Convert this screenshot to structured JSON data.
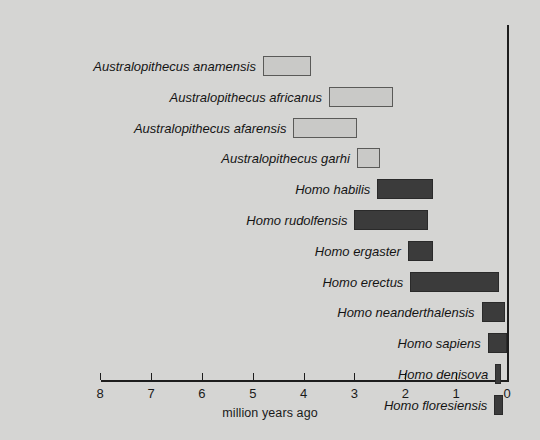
{
  "chart_data": {
    "type": "bar",
    "orientation": "horizontal-range",
    "title": "",
    "xlabel": "million years ago",
    "ylabel": "",
    "xlim": [
      8,
      0
    ],
    "x_ticks": [
      8,
      7,
      6,
      5,
      4,
      3,
      2,
      1,
      0
    ],
    "x_tick_labels": [
      "8",
      "7",
      "6",
      "5",
      "4",
      "3",
      "2",
      "1",
      "0"
    ],
    "axis_direction": "reversed",
    "grid": false,
    "legend": "none",
    "categories": [
      "Australopithecus anamensis",
      "Australopithecus africanus",
      "Australopithecus afarensis",
      "Australopithecus garhi",
      "Homo habilis",
      "Homo rudolfensis",
      "Homo ergaster",
      "Homo erectus",
      "Homo neanderthalensis",
      "Homo sapiens",
      "Homo denisova",
      "Homo floresiensis"
    ],
    "ranges": [
      {
        "label": "Australopithecus anamensis",
        "start": 4.8,
        "end": 3.85,
        "group": "Australopithecus"
      },
      {
        "label": "Australopithecus africanus",
        "start": 3.5,
        "end": 2.25,
        "group": "Australopithecus"
      },
      {
        "label": "Australopithecus afarensis",
        "start": 4.2,
        "end": 2.95,
        "group": "Australopithecus"
      },
      {
        "label": "Australopithecus garhi",
        "start": 2.95,
        "end": 2.5,
        "group": "Australopithecus"
      },
      {
        "label": "Homo habilis",
        "start": 2.55,
        "end": 1.45,
        "group": "Homo"
      },
      {
        "label": "Homo rudolfensis",
        "start": 3.0,
        "end": 1.55,
        "group": "Homo"
      },
      {
        "label": "Homo ergaster",
        "start": 1.95,
        "end": 1.45,
        "group": "Homo"
      },
      {
        "label": "Homo erectus",
        "start": 1.9,
        "end": 0.15,
        "group": "Homo"
      },
      {
        "label": "Homo neanderthalensis",
        "start": 0.5,
        "end": 0.04,
        "group": "Homo"
      },
      {
        "label": "Homo sapiens",
        "start": 0.38,
        "end": 0.0,
        "group": "Homo"
      },
      {
        "label": "Homo denisova",
        "start": 0.23,
        "end": 0.11,
        "group": "Homo"
      },
      {
        "label": "Homo floresiensis",
        "start": 0.25,
        "end": 0.07,
        "group": "Homo"
      }
    ]
  },
  "colors": {
    "background": "#d5d5d3",
    "australopithecus_fill": "#c9c9c7",
    "australopithecus_border": "#5a5a58",
    "homo_fill": "#3b3b3b",
    "axis": "#1d1d1d",
    "text": "#141414"
  },
  "layout": {
    "x_px_at_zero": 507,
    "px_per_million_years": 50.85,
    "first_row_top": 56,
    "row_pitch": 30.8,
    "bar_height": 20
  }
}
